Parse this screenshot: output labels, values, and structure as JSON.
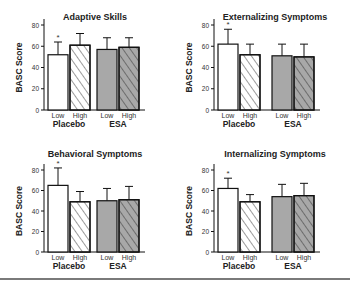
{
  "chart_data": [
    {
      "type": "bar",
      "title": "Adaptive Skills",
      "ylabel": "BASC Score",
      "xlabel": "",
      "ylim": [
        0,
        80
      ],
      "yticks": [
        0,
        20,
        40,
        60,
        80
      ],
      "groups": [
        "Placebo",
        "ESA"
      ],
      "categories": [
        "Low",
        "High",
        "Low",
        "High"
      ],
      "values": [
        52,
        61,
        57,
        59
      ],
      "errors": [
        12,
        11,
        11,
        9
      ],
      "significant": [
        true,
        false,
        false,
        false
      ]
    },
    {
      "type": "bar",
      "title": "Externalizing Symptoms",
      "ylabel": "BASC Score",
      "xlabel": "",
      "ylim": [
        0,
        80
      ],
      "yticks": [
        0,
        20,
        40,
        60,
        80
      ],
      "groups": [
        "Placebo",
        "ESA"
      ],
      "categories": [
        "Low",
        "High",
        "Low",
        "High"
      ],
      "values": [
        62,
        52,
        51,
        50
      ],
      "errors": [
        14,
        10,
        11,
        12
      ],
      "significant": [
        true,
        false,
        false,
        false
      ]
    },
    {
      "type": "bar",
      "title": "Behavioral Symptoms",
      "ylabel": "BASC Score",
      "xlabel": "",
      "ylim": [
        0,
        80
      ],
      "yticks": [
        0,
        20,
        40,
        60,
        80
      ],
      "groups": [
        "Placebo",
        "ESA"
      ],
      "categories": [
        "Low",
        "High",
        "Low",
        "High"
      ],
      "values": [
        65,
        49,
        50,
        51
      ],
      "errors": [
        17,
        10,
        12,
        13
      ],
      "significant": [
        true,
        false,
        false,
        false
      ]
    },
    {
      "type": "bar",
      "title": "Internalizing Symptoms",
      "ylabel": "BASC Score",
      "xlabel": "",
      "ylim": [
        0,
        80
      ],
      "yticks": [
        0,
        20,
        40,
        60,
        80
      ],
      "groups": [
        "Placebo",
        "ESA"
      ],
      "categories": [
        "Low",
        "High",
        "Low",
        "High"
      ],
      "values": [
        62,
        49,
        54,
        55
      ],
      "errors": [
        10,
        7,
        12,
        12
      ],
      "significant": [
        true,
        false,
        false,
        false
      ]
    }
  ],
  "styles": {
    "placebo_fill": "#ffffff",
    "esa_fill": "#a8a8a8",
    "stroke": "#111111",
    "rule": "#7a7a7a"
  },
  "marker": "*"
}
